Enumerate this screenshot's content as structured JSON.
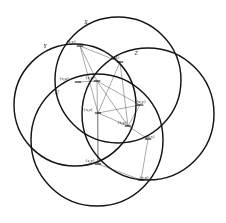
{
  "figure": {
    "stroke_color": "#141414",
    "thin_line_color": "#555555",
    "background_color": "#ffffff"
  },
  "circles": [
    {
      "name": "X",
      "label": "X",
      "cx": 118,
      "cy": 80,
      "r": 63,
      "label_x": 86,
      "label_y": 24
    },
    {
      "name": "Y",
      "label": "Y",
      "cx": 75,
      "cy": 105,
      "r": 61,
      "label_x": 45,
      "label_y": 48
    },
    {
      "name": "Z",
      "label": "Z",
      "cx": 148,
      "cy": 114,
      "r": 66,
      "label_x": 136,
      "label_y": 55
    },
    {
      "name": "U",
      "label": "U",
      "cx": 97,
      "cy": 140,
      "r": 66,
      "label_x": 57,
      "label_y": 94
    }
  ],
  "intersection_points": [
    {
      "id": "xy-top",
      "label": "{x,y}",
      "x": 80,
      "y": 46,
      "label_x": 71,
      "label_y": 43
    },
    {
      "id": "yz-upper",
      "label": "{y,z}",
      "x": 120,
      "y": 62,
      "label_x": 115,
      "label_y": 59
    },
    {
      "id": "xu-left",
      "label": "{x,u}",
      "x": 78,
      "y": 82,
      "label_x": 64,
      "label_y": 80
    },
    {
      "id": "zu-left",
      "label": "{z,u}",
      "x": 97,
      "y": 81,
      "label_x": 90,
      "label_y": 79
    },
    {
      "id": "uy-right",
      "label": "{u,y}",
      "x": 140,
      "y": 105,
      "label_x": 141,
      "label_y": 103
    },
    {
      "id": "xz-mid",
      "label": "{x,z}",
      "x": 98,
      "y": 113,
      "label_x": 88,
      "label_y": 111
    },
    {
      "id": "xy-lower",
      "label": "{x,y}",
      "x": 128,
      "y": 126,
      "label_x": 122,
      "label_y": 124
    },
    {
      "id": "ux-right",
      "label": "{u,x}",
      "x": 148,
      "y": 139,
      "label_x": 150,
      "label_y": 138
    },
    {
      "id": "zy-lower",
      "label": "{z,y}",
      "x": 98,
      "y": 164,
      "label_x": 90,
      "label_y": 162
    },
    {
      "id": "zu-bottom",
      "label": "{z,u}",
      "x": 141,
      "y": 180,
      "label_x": 144,
      "label_y": 179
    }
  ],
  "chords": [
    {
      "from": "xy-top",
      "to": "yz-upper"
    },
    {
      "from": "xy-top",
      "to": "xz-mid"
    },
    {
      "from": "xy-top",
      "to": "zu-left"
    },
    {
      "from": "yz-upper",
      "to": "xz-mid"
    },
    {
      "from": "yz-upper",
      "to": "xy-lower"
    },
    {
      "from": "zu-left",
      "to": "uy-right"
    },
    {
      "from": "zu-left",
      "to": "xy-lower"
    },
    {
      "from": "xu-left",
      "to": "zu-left"
    },
    {
      "from": "xz-mid",
      "to": "uy-right"
    },
    {
      "from": "xz-mid",
      "to": "xy-lower"
    },
    {
      "from": "xz-mid",
      "to": "zy-lower"
    },
    {
      "from": "xy-lower",
      "to": "ux-right"
    },
    {
      "from": "uy-right",
      "to": "xy-lower"
    },
    {
      "from": "zy-lower",
      "to": "zu-bottom"
    },
    {
      "from": "ux-right",
      "to": "zu-bottom"
    },
    {
      "from": "zu-left",
      "to": "zy-lower"
    }
  ]
}
